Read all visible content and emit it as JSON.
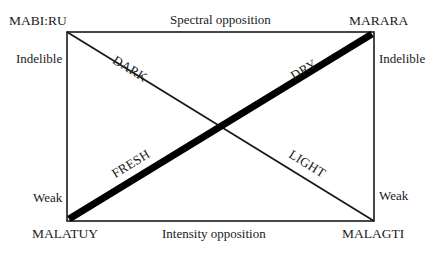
{
  "corners": {
    "top_left": "MABI:RU",
    "top_right": "MARARA",
    "bottom_left": "MALATUY",
    "bottom_right": "MALAGTI"
  },
  "edges": {
    "top": "Spectral opposition",
    "bottom": "Intensity opposition",
    "left_top": "Indelible",
    "left_bottom": "Weak",
    "right_top": "Indelible",
    "right_bottom": "Weak"
  },
  "diagonals": {
    "thin": {
      "from": "MABI:RU",
      "to": "MALAGTI",
      "upper_label": "DARK",
      "lower_label": "LIGHT"
    },
    "thick": {
      "from": "MALATUY",
      "to": "MARARA",
      "upper_label": "DRY",
      "lower_label": "FRESH"
    }
  },
  "colors": {
    "line": "#1a1a1a",
    "background": "#ffffff"
  }
}
